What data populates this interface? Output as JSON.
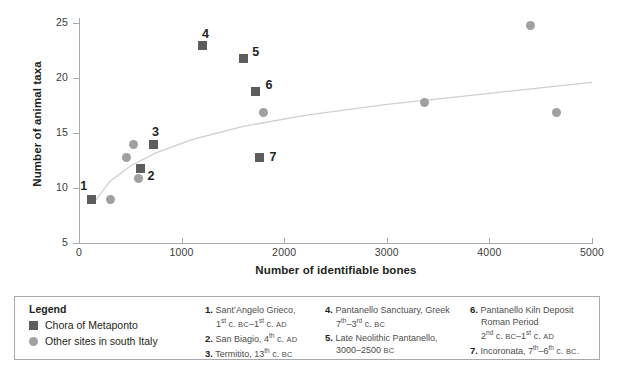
{
  "chart_data": {
    "type": "scatter",
    "title": "",
    "xlabel": "Number of identifiable bones",
    "ylabel": "Number of animal taxa",
    "xlim": [
      0,
      5000
    ],
    "ylim": [
      5,
      25
    ],
    "xticks": [
      0,
      1000,
      2000,
      3000,
      4000,
      5000
    ],
    "yticks": [
      5,
      10,
      15,
      20,
      25
    ],
    "xticklabels": [
      "0",
      "1000",
      "2000",
      "3000",
      "4000",
      "5000"
    ],
    "yticklabels": [
      "5",
      "10",
      "15",
      "20",
      "25"
    ],
    "grid": false,
    "legend_position": "below-plot",
    "series": [
      {
        "name": "Chora of Metaponto",
        "marker": "square",
        "color": "#5d5d5d",
        "points": [
          {
            "label": "1",
            "x": 120,
            "y": 9.0
          },
          {
            "label": "2",
            "x": 600,
            "y": 11.8
          },
          {
            "label": "3",
            "x": 730,
            "y": 14.0
          },
          {
            "label": "4",
            "x": 1200,
            "y": 23.0
          },
          {
            "label": "5",
            "x": 1600,
            "y": 21.8
          },
          {
            "label": "6",
            "x": 1720,
            "y": 18.8
          },
          {
            "label": "7",
            "x": 1760,
            "y": 12.8
          }
        ]
      },
      {
        "name": "Other sites in south Italy",
        "marker": "circle",
        "color": "#a0a0a0",
        "points": [
          {
            "label": "",
            "x": 310,
            "y": 9.0
          },
          {
            "label": "",
            "x": 460,
            "y": 12.8
          },
          {
            "label": "",
            "x": 530,
            "y": 14.0
          },
          {
            "label": "",
            "x": 580,
            "y": 10.9
          },
          {
            "label": "",
            "x": 1800,
            "y": 16.9
          },
          {
            "label": "",
            "x": 3370,
            "y": 17.8
          },
          {
            "label": "",
            "x": 4400,
            "y": 24.8
          },
          {
            "label": "",
            "x": 4650,
            "y": 16.9
          }
        ]
      }
    ],
    "trendline": {
      "name": "fitted logarithmic trend",
      "color": "#cfcfcf",
      "points": [
        {
          "x": 140,
          "y": 8.6
        },
        {
          "x": 300,
          "y": 10.6
        },
        {
          "x": 500,
          "y": 12.0
        },
        {
          "x": 750,
          "y": 13.2
        },
        {
          "x": 1100,
          "y": 14.4
        },
        {
          "x": 1600,
          "y": 15.6
        },
        {
          "x": 2200,
          "y": 16.6
        },
        {
          "x": 3000,
          "y": 17.6
        },
        {
          "x": 3800,
          "y": 18.4
        },
        {
          "x": 4700,
          "y": 19.3
        },
        {
          "x": 5000,
          "y": 19.6
        }
      ]
    }
  },
  "legend": {
    "title": "Legend",
    "entries": [
      {
        "marker": "square",
        "label": "Chora of Metaponto",
        "color": "#5d5d5d"
      },
      {
        "marker": "circle",
        "label": "Other sites in south Italy",
        "color": "#a0a0a0"
      }
    ],
    "notes": [
      {
        "num": "1.",
        "line1": "Sant’Angelo Grieco,",
        "line2": "1st c. BC–1st c. AD"
      },
      {
        "num": "2.",
        "line1": "San Biagio, 4th c. AD",
        "line2": ""
      },
      {
        "num": "3.",
        "line1": "Termitito, 13th c. BC",
        "line2": ""
      },
      {
        "num": "4.",
        "line1": "Pantanello Sanctuary, Greek",
        "line2": "7th–3rd c. BC"
      },
      {
        "num": "5.",
        "line1": "Late Neolithic Pantanello,",
        "line2": "3000–2500 BC"
      },
      {
        "num": "6.",
        "line1": "Pantanello Kiln Deposit",
        "line2": "Roman Period",
        "line3": "2nd c. BC–1st c. AD"
      },
      {
        "num": "7.",
        "line1": "Incoronata, 7th–6th c. BC.",
        "line2": ""
      }
    ]
  }
}
